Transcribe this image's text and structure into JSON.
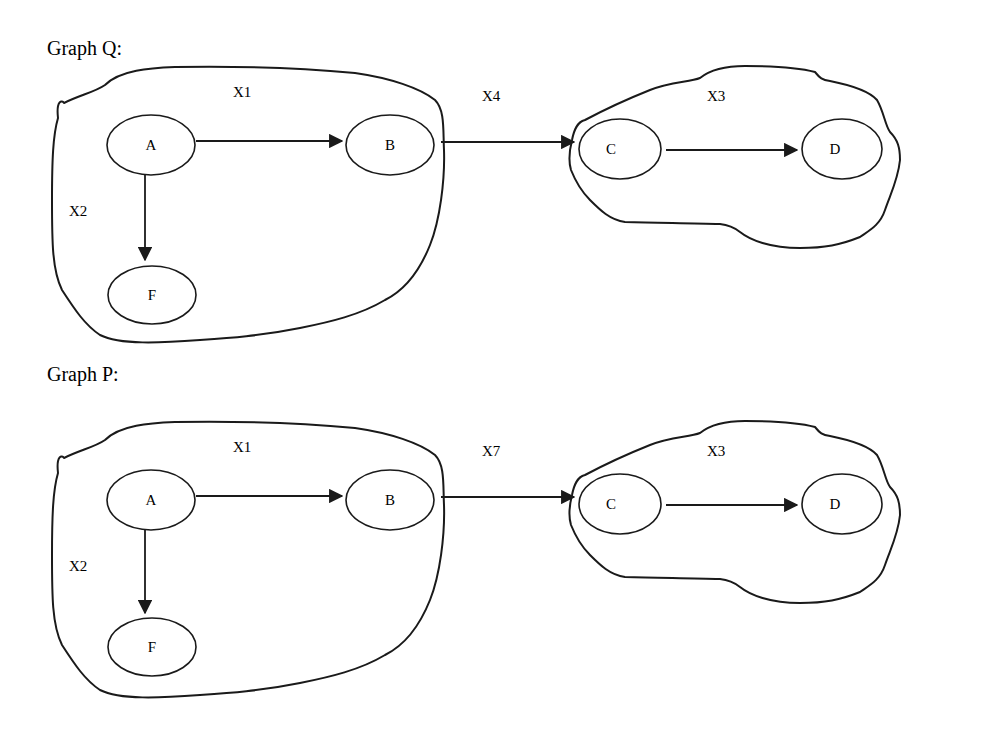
{
  "graphs": [
    {
      "title": "Graph Q:",
      "regions": [
        {
          "id": "X1",
          "label": "X1"
        },
        {
          "id": "X3",
          "label": "X3"
        }
      ],
      "edge_labels": {
        "x2": "X2",
        "bridge": "X4"
      },
      "nodes": {
        "A": "A",
        "B": "B",
        "C": "C",
        "D": "D",
        "F": "F"
      },
      "edges": [
        {
          "from": "A",
          "to": "B"
        },
        {
          "from": "A",
          "to": "F"
        },
        {
          "from": "B",
          "to": "C",
          "label": "X4"
        },
        {
          "from": "C",
          "to": "D"
        }
      ]
    },
    {
      "title": "Graph P:",
      "regions": [
        {
          "id": "X1",
          "label": "X1"
        },
        {
          "id": "X3",
          "label": "X3"
        }
      ],
      "edge_labels": {
        "x2": "X2",
        "bridge": "X7"
      },
      "nodes": {
        "A": "A",
        "B": "B",
        "C": "C",
        "D": "D",
        "F": "F"
      },
      "edges": [
        {
          "from": "A",
          "to": "B"
        },
        {
          "from": "A",
          "to": "F"
        },
        {
          "from": "B",
          "to": "C",
          "label": "X7"
        },
        {
          "from": "C",
          "to": "D"
        }
      ]
    }
  ]
}
